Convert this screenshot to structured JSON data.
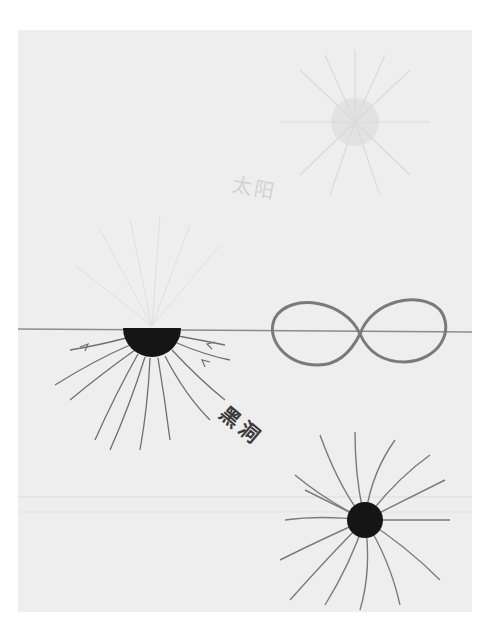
{
  "drawing": {
    "background_color": "#eeeeee",
    "labels": {
      "sun": "太阳",
      "black_hole": "黑洞"
    },
    "elements": {
      "sun": {
        "cx": 355,
        "cy": 120,
        "r": 22,
        "color": "#d9d9d9"
      },
      "horizon_line": {
        "y": 330,
        "color": "#8a8a8a"
      },
      "half_black_hole": {
        "cx": 152,
        "cy": 328,
        "r": 29,
        "color": "#151515"
      },
      "infinity_symbol": {
        "color": "#7a7a7a"
      },
      "spiral_black_hole": {
        "cx": 365,
        "cy": 520,
        "r": 18,
        "color": "#151515"
      }
    }
  }
}
